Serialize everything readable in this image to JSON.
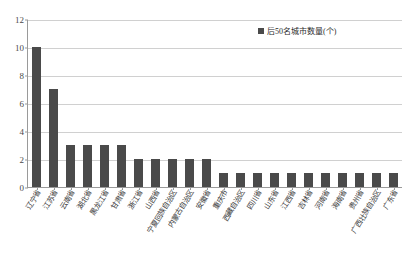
{
  "chart_data": {
    "type": "bar",
    "title": "",
    "xlabel": "",
    "ylabel": "",
    "ylim": [
      0,
      12
    ],
    "yticks": [
      0,
      2,
      4,
      6,
      8,
      10,
      12
    ],
    "grid": true,
    "legend_position": "top-right",
    "legend": [
      "后50名城市数量(个)"
    ],
    "series_name": "后50名城市数量(个)",
    "bar_color": "#4a4a4a",
    "categories": [
      "辽宁省",
      "江苏省",
      "云南省",
      "湖北省",
      "黑龙江省",
      "甘肃省",
      "浙江省",
      "山西省",
      "宁夏回族自治区",
      "内蒙古自治区",
      "安徽省",
      "重庆市",
      "西藏自治区",
      "四川省",
      "山东省",
      "江西省",
      "吉林省",
      "河南省",
      "海南省",
      "贵州省",
      "广西壮族自治区",
      "广东省"
    ],
    "values": [
      10,
      7,
      3,
      3,
      3,
      3,
      2,
      2,
      2,
      2,
      2,
      1,
      1,
      1,
      1,
      1,
      1,
      1,
      1,
      1,
      1,
      1
    ]
  }
}
